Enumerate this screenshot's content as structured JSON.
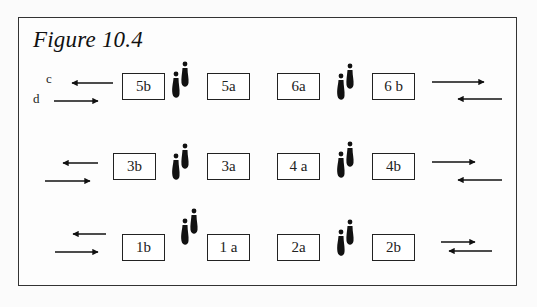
{
  "figure": {
    "title": "Figure 10.4",
    "legend": {
      "c_label": "c",
      "d_label": "d"
    },
    "rows": [
      {
        "row": "top",
        "boxes": [
          "5b",
          "5a",
          "6a",
          "6 b"
        ]
      },
      {
        "row": "middle",
        "boxes": [
          "3b",
          "3a",
          "4 a",
          "4b"
        ]
      },
      {
        "row": "bottom",
        "boxes": [
          "1b",
          "1 a",
          "2a",
          "2b"
        ]
      }
    ],
    "icons": {
      "footprints": "footprints-icon",
      "arrow_left": "arrow-left-icon",
      "arrow_right": "arrow-right-icon"
    }
  }
}
